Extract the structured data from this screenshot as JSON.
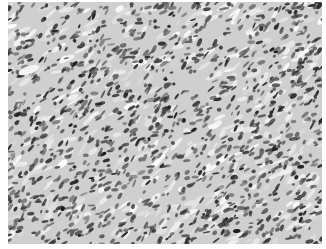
{
  "image": {
    "kind": "grayscale histology micrograph",
    "description": "Densely cellular tissue with elongated, spindle-shaped dark nuclei arranged in fascicles oriented diagonally, on a pale gray stroma",
    "colors": {
      "background": "#ffffff",
      "stroma": "#c9c9c9",
      "stroma_light": "#e6e6e6",
      "nuclei": "#2b2b2b",
      "nuclei_mid": "#5a5a5a"
    },
    "frame": {
      "left": 8,
      "top": 2,
      "width": 314,
      "height": 242
    },
    "features": [
      {
        "name": "vessel-lumen",
        "x": 10,
        "y": 64,
        "w": 22,
        "h": 8
      }
    ]
  }
}
